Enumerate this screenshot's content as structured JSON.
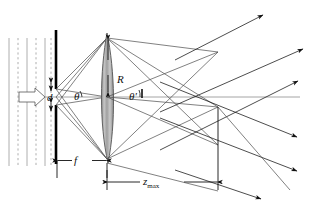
{
  "figure": {
    "labels": {
      "aperture_width": "d",
      "incidence_angle": "θ",
      "refraction_angle": "θ′",
      "lens_radius": "R",
      "focal_length": "f",
      "zmax_symbol": "z",
      "zmax_subscript": "max"
    },
    "colors": {
      "stroke": "#111111",
      "ray": "#4a4a4a",
      "wavefront": "#9a9a9a",
      "lens_fill": "#b8b8b8",
      "lens_edge": "#555555",
      "mask": "#000000",
      "arrow_fill": "#ffffff"
    },
    "elements": {
      "wavefronts_count": 6,
      "output_rays_up": 3,
      "output_rays_down": 3,
      "optical_axis_y": 97,
      "mask_x": 55,
      "lens_x": 107,
      "focus_x": 218
    }
  }
}
